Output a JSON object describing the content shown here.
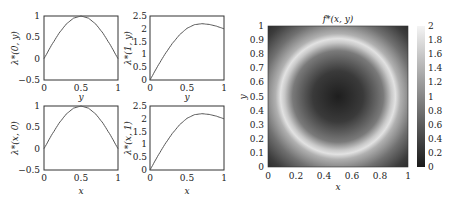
{
  "chart_data": [
    {
      "type": "line",
      "panel": "top-left",
      "title": "",
      "xlabel": "y",
      "ylabel": "λ*(0, y)",
      "xlim": [
        0,
        1
      ],
      "ylim": [
        -0.5,
        1
      ],
      "xticks": [
        "0",
        "0.5",
        "1"
      ],
      "yticks": [
        "-0.5",
        "0",
        "0.5",
        "1"
      ],
      "x": [
        0,
        0.1,
        0.2,
        0.3,
        0.4,
        0.5,
        0.6,
        0.7,
        0.8,
        0.9,
        1.0
      ],
      "y": [
        0,
        0.31,
        0.59,
        0.81,
        0.95,
        1.0,
        0.95,
        0.81,
        0.59,
        0.31,
        0
      ],
      "grid": false
    },
    {
      "type": "line",
      "panel": "top-right",
      "title": "",
      "xlabel": "y",
      "ylabel": "λ*(1, y)",
      "xlim": [
        0,
        1
      ],
      "ylim": [
        0,
        2.5
      ],
      "xticks": [
        "0",
        "0.5",
        "1"
      ],
      "yticks": [
        "0",
        "0.5",
        "1",
        "1.5",
        "2",
        "2.5"
      ],
      "x": [
        0,
        0.1,
        0.2,
        0.3,
        0.4,
        0.5,
        0.6,
        0.7,
        0.8,
        0.9,
        1.0
      ],
      "y": [
        0,
        0.52,
        1.0,
        1.42,
        1.77,
        2.02,
        2.16,
        2.2,
        2.17,
        2.1,
        2.0
      ],
      "grid": false
    },
    {
      "type": "line",
      "panel": "bottom-left",
      "title": "",
      "xlabel": "x",
      "ylabel": "λ*(x, 0)",
      "xlim": [
        0,
        1
      ],
      "ylim": [
        -0.5,
        1
      ],
      "xticks": [
        "0",
        "0.5",
        "1"
      ],
      "yticks": [
        "-0.5",
        "0",
        "0.5",
        "1"
      ],
      "x": [
        0,
        0.1,
        0.2,
        0.3,
        0.4,
        0.5,
        0.6,
        0.7,
        0.8,
        0.9,
        1.0
      ],
      "y": [
        0,
        0.31,
        0.59,
        0.81,
        0.95,
        1.0,
        0.95,
        0.81,
        0.59,
        0.31,
        0
      ],
      "grid": false
    },
    {
      "type": "line",
      "panel": "bottom-right",
      "title": "",
      "xlabel": "x",
      "ylabel": "λ*(x, 1)",
      "xlim": [
        0,
        1
      ],
      "ylim": [
        0,
        2.5
      ],
      "xticks": [
        "0",
        "0.5",
        "1"
      ],
      "yticks": [
        "0",
        "0.5",
        "1",
        "1.5",
        "2",
        "2.5"
      ],
      "x": [
        0,
        0.1,
        0.2,
        0.3,
        0.4,
        0.5,
        0.6,
        0.7,
        0.8,
        0.9,
        1.0
      ],
      "y": [
        0,
        0.52,
        1.0,
        1.42,
        1.77,
        2.02,
        2.16,
        2.2,
        2.17,
        2.1,
        2.0
      ],
      "grid": false
    },
    {
      "type": "heatmap",
      "panel": "right",
      "title": "f*(x, y)",
      "xlabel": "x",
      "ylabel": "y",
      "xlim": [
        0,
        1
      ],
      "ylim": [
        0,
        1
      ],
      "xticks": [
        "0",
        "0.2",
        "0.4",
        "0.6",
        "0.8",
        "1"
      ],
      "yticks": [
        "0",
        "0.1",
        "0.2",
        "0.3",
        "0.4",
        "0.5",
        "0.6",
        "0.7",
        "0.8",
        "0.9",
        "1"
      ],
      "colorbar": {
        "min": 0,
        "max": 2,
        "ticks": [
          "0",
          "0.2",
          "0.4",
          "0.6",
          "0.8",
          "1",
          "1.2",
          "1.4",
          "1.6",
          "1.8",
          "2"
        ],
        "colormap": "gray"
      },
      "description": "Radially symmetric field centered at (0.5, 0.5): dark center (~0.3), bright ring (~1.8) at radius ~0.4, darker corners (~0.5)"
    }
  ],
  "labels": {
    "p1_ylabel": "λ*(0, y)",
    "p2_ylabel": "λ*(1, y)",
    "p3_ylabel": "λ*(x, 0)",
    "p4_ylabel": "λ*(x, 1)",
    "top_xlabel": "y",
    "bottom_xlabel": "x",
    "heat_title": "f*(x, y)",
    "heat_xlabel": "x",
    "heat_ylabel": "y"
  }
}
